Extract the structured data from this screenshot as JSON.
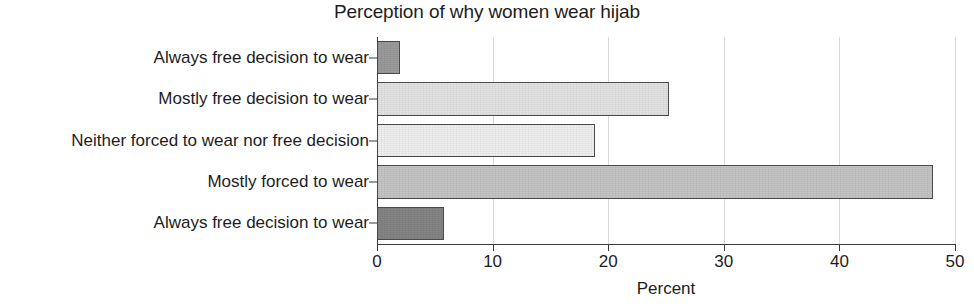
{
  "chart_data": {
    "type": "bar",
    "orientation": "horizontal",
    "title": "Perception of why women wear hijab",
    "xlabel": "Percent",
    "ylabel": "",
    "xlim": [
      0,
      50
    ],
    "xticks": [
      0,
      10,
      20,
      30,
      40,
      50
    ],
    "xticklabels": [
      "0",
      "10",
      "20",
      "30",
      "40",
      "50"
    ],
    "grid": "vertical",
    "legend": "none",
    "categories": [
      "Always free decision to wear",
      "Mostly free decision to wear",
      "Neither forced to wear nor free decision",
      "Mostly forced to wear",
      "Always free decision to wear"
    ],
    "values": [
      2.0,
      25.3,
      18.9,
      48.1,
      5.8
    ],
    "bar_colors": [
      "#9a9a9a",
      "#e2e2e2",
      "#efefef",
      "#c4c4c4",
      "#848484"
    ],
    "bar_edge_color": "#4a4a4a",
    "background_color": "#ffffff",
    "grid_color": "#d8d8d8",
    "axis_color": "#3a3a3a",
    "text_color": "#1d1d1d"
  }
}
